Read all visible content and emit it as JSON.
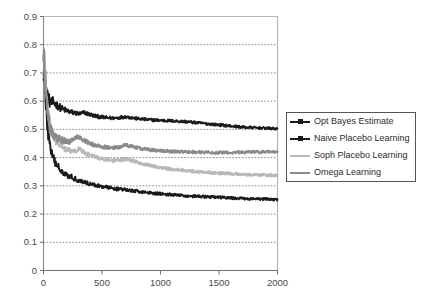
{
  "chart_data": {
    "type": "line",
    "title": "",
    "xlabel": "",
    "ylabel": "",
    "xlim": [
      0,
      2000
    ],
    "ylim": [
      0,
      0.9
    ],
    "grid": true,
    "grid_axis": "y",
    "legend_position": "right",
    "x_ticks": [
      "0",
      "500",
      "1000",
      "1500",
      "2000"
    ],
    "x_tick_values": [
      0,
      500,
      1000,
      1500,
      2000
    ],
    "y_ticks": [
      "0",
      "0.1",
      "0.2",
      "0.3",
      "0.4",
      "0.5",
      "0.6",
      "0.7",
      "0.8",
      "0.9"
    ],
    "y_tick_values": [
      0,
      0.1,
      0.2,
      0.3,
      0.4,
      0.5,
      0.6,
      0.7,
      0.8,
      0.9
    ],
    "x": [
      0,
      10,
      20,
      30,
      40,
      50,
      60,
      70,
      80,
      90,
      100,
      125,
      150,
      175,
      200,
      225,
      250,
      275,
      300,
      325,
      350,
      375,
      400,
      425,
      450,
      475,
      500,
      550,
      600,
      650,
      700,
      750,
      800,
      850,
      900,
      950,
      1000,
      1050,
      1100,
      1150,
      1200,
      1250,
      1300,
      1350,
      1400,
      1450,
      1500,
      1550,
      1600,
      1650,
      1700,
      1750,
      1800,
      1850,
      1900,
      1950,
      2000
    ],
    "series": [
      {
        "name": "Opt Bayes Estimate",
        "color": "#1a1a1a",
        "marker": "square",
        "final_value": 0.502,
        "values": [
          0.735,
          0.7,
          0.66,
          0.632,
          0.612,
          0.6,
          0.595,
          0.592,
          0.597,
          0.594,
          0.59,
          0.583,
          0.575,
          0.57,
          0.566,
          0.562,
          0.56,
          0.558,
          0.555,
          0.556,
          0.56,
          0.556,
          0.552,
          0.549,
          0.547,
          0.545,
          0.543,
          0.541,
          0.54,
          0.542,
          0.545,
          0.542,
          0.538,
          0.536,
          0.534,
          0.533,
          0.532,
          0.531,
          0.53,
          0.529,
          0.528,
          0.526,
          0.524,
          0.522,
          0.52,
          0.518,
          0.516,
          0.514,
          0.512,
          0.51,
          0.508,
          0.507,
          0.506,
          0.505,
          0.504,
          0.503,
          0.502
        ]
      },
      {
        "name": "Naive Placebo Learning",
        "color": "#1a1a1a",
        "marker": "square",
        "final_value": 0.251,
        "values": [
          0.74,
          0.66,
          0.59,
          0.53,
          0.485,
          0.455,
          0.432,
          0.414,
          0.4,
          0.39,
          0.382,
          0.368,
          0.356,
          0.347,
          0.34,
          0.334,
          0.329,
          0.324,
          0.32,
          0.316,
          0.313,
          0.31,
          0.307,
          0.304,
          0.302,
          0.3,
          0.298,
          0.294,
          0.291,
          0.288,
          0.286,
          0.283,
          0.281,
          0.278,
          0.276,
          0.274,
          0.272,
          0.27,
          0.268,
          0.267,
          0.265,
          0.264,
          0.263,
          0.262,
          0.261,
          0.26,
          0.259,
          0.258,
          0.257,
          0.256,
          0.255,
          0.254,
          0.254,
          0.253,
          0.253,
          0.252,
          0.251
        ]
      },
      {
        "name": "Soph Placebo Learning",
        "color": "#b8b8b8",
        "marker": "line",
        "final_value": 0.337,
        "values": [
          0.79,
          0.72,
          0.655,
          0.6,
          0.56,
          0.53,
          0.508,
          0.492,
          0.48,
          0.47,
          0.463,
          0.45,
          0.441,
          0.434,
          0.429,
          0.424,
          0.421,
          0.425,
          0.43,
          0.424,
          0.418,
          0.412,
          0.408,
          0.404,
          0.401,
          0.398,
          0.396,
          0.392,
          0.389,
          0.391,
          0.395,
          0.39,
          0.384,
          0.378,
          0.373,
          0.369,
          0.365,
          0.362,
          0.359,
          0.357,
          0.355,
          0.353,
          0.351,
          0.349,
          0.348,
          0.346,
          0.345,
          0.344,
          0.343,
          0.342,
          0.341,
          0.34,
          0.34,
          0.339,
          0.338,
          0.338,
          0.337
        ]
      },
      {
        "name": "Omega Learning",
        "color": "#8a8a8a",
        "marker": "line",
        "final_value": 0.421,
        "values": [
          0.775,
          0.7,
          0.635,
          0.585,
          0.548,
          0.522,
          0.504,
          0.492,
          0.484,
          0.478,
          0.474,
          0.468,
          0.463,
          0.459,
          0.456,
          0.458,
          0.464,
          0.47,
          0.474,
          0.468,
          0.461,
          0.455,
          0.45,
          0.446,
          0.443,
          0.441,
          0.439,
          0.436,
          0.434,
          0.438,
          0.444,
          0.44,
          0.435,
          0.431,
          0.428,
          0.426,
          0.424,
          0.423,
          0.422,
          0.422,
          0.421,
          0.42,
          0.42,
          0.419,
          0.419,
          0.418,
          0.418,
          0.418,
          0.418,
          0.419,
          0.419,
          0.42,
          0.42,
          0.42,
          0.421,
          0.421,
          0.421
        ]
      }
    ]
  },
  "legend": {
    "entries": [
      {
        "label": "Opt Bayes Estimate"
      },
      {
        "label": "Naive Placebo Learning"
      },
      {
        "label": "Soph Placebo Learning"
      },
      {
        "label": "Omega Learning"
      }
    ]
  }
}
